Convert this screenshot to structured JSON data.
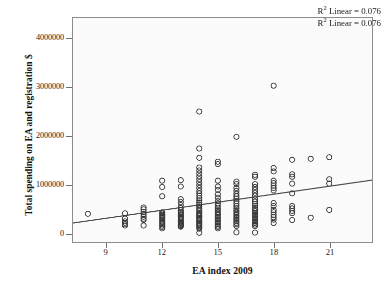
{
  "chart_data": {
    "type": "scatter",
    "title": "",
    "xlabel": "EA index 2009",
    "ylabel": "Total spending on EA and registration $",
    "xlim": [
      7.2,
      23.3
    ],
    "ylim": [
      -180000,
      4420000
    ],
    "xticks": [
      9,
      12,
      15,
      18,
      21
    ],
    "xticklabels": [
      "9",
      "12",
      "15",
      "18",
      "21"
    ],
    "yticks": [
      0,
      1000000,
      2000000,
      3000000,
      4000000
    ],
    "yticklabels": [
      "0",
      "1000000",
      "2000000",
      "3000000",
      "4000000"
    ],
    "grid": false,
    "legend_position": "top-right",
    "legend": [
      "R² Linear = 0.076",
      "R² Linear = 0.076"
    ],
    "marker": {
      "style": "open-circle",
      "radius": 2.6,
      "edge_color": "#3a3a3a",
      "fill_color": "none",
      "edge_width": 0.9
    },
    "fit_line": {
      "type": "linear",
      "color": "#4a4a4a",
      "width": 1.1,
      "r_squared": 0.076,
      "x_endpoints": [
        7.2,
        23.3
      ],
      "y_endpoints": [
        210000,
        1090000
      ]
    },
    "points": [
      [
        8.0,
        400000
      ],
      [
        10.0,
        410000
      ],
      [
        10.0,
        300000
      ],
      [
        10.0,
        245000
      ],
      [
        10.0,
        215000
      ],
      [
        10.0,
        185000
      ],
      [
        10.0,
        160000
      ],
      [
        11.0,
        530000
      ],
      [
        11.0,
        490000
      ],
      [
        11.0,
        440000
      ],
      [
        11.0,
        395000
      ],
      [
        11.0,
        340000
      ],
      [
        11.0,
        300000
      ],
      [
        11.0,
        275000
      ],
      [
        11.0,
        160000
      ],
      [
        12.0,
        1080000
      ],
      [
        12.0,
        950000
      ],
      [
        12.0,
        760000
      ],
      [
        12.0,
        430000
      ],
      [
        12.0,
        405000
      ],
      [
        12.0,
        380000
      ],
      [
        12.0,
        360000
      ],
      [
        12.0,
        335000
      ],
      [
        12.0,
        310000
      ],
      [
        12.0,
        285000
      ],
      [
        12.0,
        260000
      ],
      [
        12.0,
        235000
      ],
      [
        12.0,
        210000
      ],
      [
        12.0,
        185000
      ],
      [
        12.0,
        160000
      ],
      [
        12.0,
        130000
      ],
      [
        12.0,
        100000
      ],
      [
        13.0,
        1090000
      ],
      [
        13.0,
        960000
      ],
      [
        13.0,
        700000
      ],
      [
        13.0,
        640000
      ],
      [
        13.0,
        580000
      ],
      [
        13.0,
        520000
      ],
      [
        13.0,
        470000
      ],
      [
        13.0,
        440000
      ],
      [
        13.0,
        415000
      ],
      [
        13.0,
        390000
      ],
      [
        13.0,
        365000
      ],
      [
        13.0,
        340000
      ],
      [
        13.0,
        315000
      ],
      [
        13.0,
        290000
      ],
      [
        13.0,
        265000
      ],
      [
        13.0,
        240000
      ],
      [
        13.0,
        215000
      ],
      [
        13.0,
        195000
      ],
      [
        13.0,
        175000
      ],
      [
        13.0,
        155000
      ],
      [
        13.0,
        135000
      ],
      [
        14.0,
        2500000
      ],
      [
        14.0,
        1740000
      ],
      [
        14.0,
        1550000
      ],
      [
        14.0,
        1350000
      ],
      [
        14.0,
        1290000
      ],
      [
        14.0,
        1230000
      ],
      [
        14.0,
        1170000
      ],
      [
        14.0,
        1110000
      ],
      [
        14.0,
        1050000
      ],
      [
        14.0,
        990000
      ],
      [
        14.0,
        930000
      ],
      [
        14.0,
        870000
      ],
      [
        14.0,
        820000
      ],
      [
        14.0,
        770000
      ],
      [
        14.0,
        720000
      ],
      [
        14.0,
        675000
      ],
      [
        14.0,
        630000
      ],
      [
        14.0,
        590000
      ],
      [
        14.0,
        550000
      ],
      [
        14.0,
        515000
      ],
      [
        14.0,
        480000
      ],
      [
        14.0,
        450000
      ],
      [
        14.0,
        420000
      ],
      [
        14.0,
        395000
      ],
      [
        14.0,
        370000
      ],
      [
        14.0,
        345000
      ],
      [
        14.0,
        320000
      ],
      [
        14.0,
        295000
      ],
      [
        14.0,
        270000
      ],
      [
        14.0,
        245000
      ],
      [
        14.0,
        220000
      ],
      [
        14.0,
        195000
      ],
      [
        14.0,
        170000
      ],
      [
        14.0,
        145000
      ],
      [
        14.0,
        120000
      ],
      [
        14.0,
        95000
      ],
      [
        14.0,
        10000
      ],
      [
        15.0,
        1470000
      ],
      [
        15.0,
        1420000
      ],
      [
        15.0,
        1080000
      ],
      [
        15.0,
        960000
      ],
      [
        15.0,
        890000
      ],
      [
        15.0,
        800000
      ],
      [
        15.0,
        730000
      ],
      [
        15.0,
        660000
      ],
      [
        15.0,
        610000
      ],
      [
        15.0,
        560000
      ],
      [
        15.0,
        510000
      ],
      [
        15.0,
        470000
      ],
      [
        15.0,
        435000
      ],
      [
        15.0,
        400000
      ],
      [
        15.0,
        370000
      ],
      [
        15.0,
        340000
      ],
      [
        15.0,
        310000
      ],
      [
        15.0,
        280000
      ],
      [
        15.0,
        250000
      ],
      [
        15.0,
        220000
      ],
      [
        15.0,
        190000
      ],
      [
        15.0,
        160000
      ],
      [
        15.0,
        130000
      ],
      [
        15.0,
        100000
      ],
      [
        16.0,
        1980000
      ],
      [
        16.0,
        1060000
      ],
      [
        16.0,
        1010000
      ],
      [
        16.0,
        930000
      ],
      [
        16.0,
        870000
      ],
      [
        16.0,
        810000
      ],
      [
        16.0,
        760000
      ],
      [
        16.0,
        710000
      ],
      [
        16.0,
        660000
      ],
      [
        16.0,
        610000
      ],
      [
        16.0,
        560000
      ],
      [
        16.0,
        510000
      ],
      [
        16.0,
        470000
      ],
      [
        16.0,
        435000
      ],
      [
        16.0,
        400000
      ],
      [
        16.0,
        370000
      ],
      [
        16.0,
        340000
      ],
      [
        16.0,
        310000
      ],
      [
        16.0,
        280000
      ],
      [
        16.0,
        250000
      ],
      [
        16.0,
        215000
      ],
      [
        16.0,
        185000
      ],
      [
        16.0,
        150000
      ],
      [
        16.0,
        20000
      ],
      [
        17.0,
        1200000
      ],
      [
        17.0,
        1160000
      ],
      [
        17.0,
        1010000
      ],
      [
        17.0,
        950000
      ],
      [
        17.0,
        890000
      ],
      [
        17.0,
        830000
      ],
      [
        17.0,
        770000
      ],
      [
        17.0,
        700000
      ],
      [
        17.0,
        650000
      ],
      [
        17.0,
        600000
      ],
      [
        17.0,
        560000
      ],
      [
        17.0,
        520000
      ],
      [
        17.0,
        480000
      ],
      [
        17.0,
        450000
      ],
      [
        17.0,
        420000
      ],
      [
        17.0,
        390000
      ],
      [
        17.0,
        360000
      ],
      [
        17.0,
        330000
      ],
      [
        17.0,
        300000
      ],
      [
        17.0,
        270000
      ],
      [
        17.0,
        240000
      ],
      [
        17.0,
        210000
      ],
      [
        17.0,
        180000
      ],
      [
        17.0,
        150000
      ],
      [
        17.0,
        15000
      ],
      [
        18.0,
        3030000
      ],
      [
        18.0,
        1340000
      ],
      [
        18.0,
        1270000
      ],
      [
        18.0,
        1080000
      ],
      [
        18.0,
        1030000
      ],
      [
        18.0,
        980000
      ],
      [
        18.0,
        930000
      ],
      [
        18.0,
        880000
      ],
      [
        18.0,
        620000
      ],
      [
        18.0,
        560000
      ],
      [
        18.0,
        480000
      ],
      [
        18.0,
        430000
      ],
      [
        18.0,
        380000
      ],
      [
        18.0,
        330000
      ],
      [
        18.0,
        280000
      ],
      [
        18.0,
        210000
      ],
      [
        19.0,
        1510000
      ],
      [
        19.0,
        1210000
      ],
      [
        19.0,
        1160000
      ],
      [
        19.0,
        1020000
      ],
      [
        19.0,
        820000
      ],
      [
        19.0,
        560000
      ],
      [
        19.0,
        510000
      ],
      [
        19.0,
        460000
      ],
      [
        19.0,
        410000
      ],
      [
        19.0,
        270000
      ],
      [
        20.0,
        1530000
      ],
      [
        20.0,
        320000
      ],
      [
        21.0,
        1560000
      ],
      [
        21.0,
        1110000
      ],
      [
        21.0,
        1020000
      ],
      [
        21.0,
        480000
      ]
    ]
  }
}
